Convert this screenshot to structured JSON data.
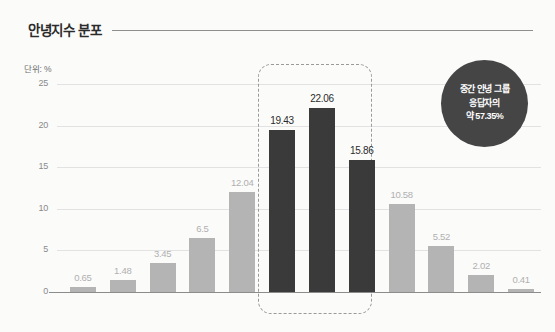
{
  "header": {
    "title": "안녕지수 분포"
  },
  "chart_data": {
    "type": "bar",
    "title": "안녕지수 분포",
    "unit_label": "단위: %",
    "xlabel": "",
    "ylabel": "",
    "ylim": [
      0,
      25
    ],
    "yticks": [
      0,
      5,
      10,
      15,
      20,
      25
    ],
    "grid": true,
    "legend": "none",
    "categories": [
      "0점",
      "1점 미만",
      "1점대",
      "2점대",
      "3점대",
      "4점대",
      "5점대",
      "6점대",
      "7점대",
      "8점대",
      "9점대",
      "10점"
    ],
    "values": [
      0.65,
      1.48,
      3.45,
      6.5,
      12.04,
      19.43,
      22.06,
      15.86,
      10.58,
      5.52,
      2.02,
      0.41
    ],
    "value_labels": [
      "0.65",
      "1.48",
      "3.45",
      "6.5",
      "12.04",
      "19.43",
      "22.06",
      "15.86",
      "10.58",
      "5.52",
      "2.02",
      "0.41"
    ],
    "highlighted": [
      false,
      false,
      false,
      false,
      false,
      true,
      true,
      true,
      false,
      false,
      false,
      false
    ],
    "colors": {
      "bar_default": "#b4b4b4",
      "bar_highlight": "#3a3a3a",
      "badge": "#454545",
      "gridline": "#e2e2e2",
      "axis": "#8c8c8c",
      "background": "#fbfbfa"
    },
    "annotations": [
      {
        "name": "highlight-region",
        "type": "dashed-box",
        "covers": [
          "4점대",
          "5점대",
          "6점대"
        ]
      },
      {
        "name": "callout-badge",
        "lines": [
          "중간 안녕 그룹",
          "응답자의",
          "약 57.35%"
        ],
        "value": 57.35
      }
    ]
  },
  "callout": {
    "line1": "중간 안녕 그룹",
    "line2": "응답자의",
    "line3": "약 57.35%"
  }
}
